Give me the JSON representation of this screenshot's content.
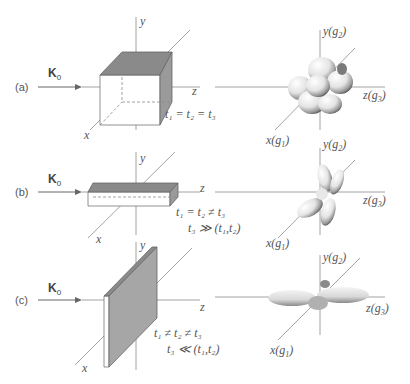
{
  "figure": {
    "panels": [
      {
        "label": "(a)",
        "beam": "K",
        "beam_sub": "0",
        "sample_shape": "cube",
        "axes": {
          "x": "x",
          "y": "y",
          "z": "z"
        },
        "condition_1": "t₁ = t₂ = t₃",
        "condition_2": "",
        "reciprocal_axes": {
          "x": "x(g",
          "x_sub": "1",
          "y": "y(g",
          "y_sub": "2",
          "z": "z(g",
          "z_sub": "3",
          "close": ")"
        },
        "reciprocal_shape": "cluster of lobes (near-isotropic)"
      },
      {
        "label": "(b)",
        "beam": "K",
        "beam_sub": "0",
        "sample_shape": "elongated rod along z",
        "axes": {
          "x": "x",
          "y": "y",
          "z": "z"
        },
        "condition_1": "t₁ = t₂ ≠ t₃",
        "condition_2": "t₃ ≫ (t₁,t₂)",
        "reciprocal_axes": {
          "x": "x(g",
          "x_sub": "1",
          "y": "y(g",
          "y_sub": "2",
          "z": "z(g",
          "z_sub": "3",
          "close": ")"
        },
        "reciprocal_shape": "lobes elongated in x–y plane"
      },
      {
        "label": "(c)",
        "beam": "K",
        "beam_sub": "0",
        "sample_shape": "thin plate in x–y plane",
        "axes": {
          "x": "x",
          "y": "y",
          "z": "z"
        },
        "condition_1": "t₁ ≠ t₂ ≠ t₃",
        "condition_2": "t₃ ≪ (t₁,t₂)",
        "reciprocal_axes": {
          "x": "x(g",
          "x_sub": "1",
          "y": "y(g",
          "y_sub": "2",
          "z": "z(g",
          "z_sub": "3",
          "close": ")"
        },
        "reciprocal_shape": "flattened disc along z"
      }
    ],
    "colors": {
      "line": "#888888",
      "face_dark": "#8a8a8a",
      "face_mid": "#a8a8a8",
      "text": "#555555"
    }
  }
}
